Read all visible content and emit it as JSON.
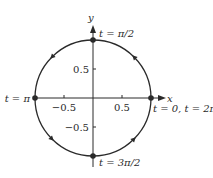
{
  "diagram": {
    "direction": "counterclockwise",
    "axes": {
      "x_label": "x",
      "y_label": "y",
      "x_ticks": [
        {
          "value": -0.5,
          "label": "−0.5"
        },
        {
          "value": 0.5,
          "label": "0.5"
        }
      ],
      "y_ticks": [
        {
          "value": 0.5,
          "label": "0.5"
        },
        {
          "value": -0.5,
          "label": "−0.5"
        }
      ]
    },
    "points": [
      {
        "id": "t0",
        "x": 1,
        "y": 0,
        "label": "t = 0, t = 2π"
      },
      {
        "id": "t_half_pi",
        "x": 0,
        "y": 1,
        "label": "t = π/2"
      },
      {
        "id": "t_pi",
        "x": -1,
        "y": 0,
        "label": "t = π"
      },
      {
        "id": "t_3half_pi",
        "x": 0,
        "y": -1,
        "label": "t = 3π/2"
      }
    ],
    "arrows_at_angles_deg": [
      45,
      135,
      225,
      315
    ],
    "colors": {
      "stroke": "#2a2a2a",
      "background": "#ffffff"
    }
  }
}
